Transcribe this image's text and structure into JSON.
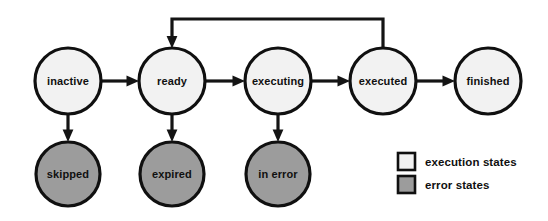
{
  "diagram": {
    "colors": {
      "background": "#ffffff",
      "stroke": "#101010",
      "execution_fill": "#f2f2f2",
      "error_fill": "#9c9c9c"
    },
    "nodes": [
      {
        "id": "inactive",
        "label": "inactive",
        "cx": 68,
        "cy": 81,
        "r": 33,
        "kind": "execution"
      },
      {
        "id": "ready",
        "label": "ready",
        "cx": 172,
        "cy": 81,
        "r": 33,
        "kind": "execution"
      },
      {
        "id": "executing",
        "label": "executing",
        "cx": 278,
        "cy": 81,
        "r": 33,
        "kind": "execution"
      },
      {
        "id": "executed",
        "label": "executed",
        "cx": 383,
        "cy": 81,
        "r": 33,
        "kind": "execution"
      },
      {
        "id": "finished",
        "label": "finished",
        "cx": 488,
        "cy": 81,
        "r": 33,
        "kind": "execution"
      },
      {
        "id": "skipped",
        "label": "skipped",
        "cx": 68,
        "cy": 174,
        "r": 32,
        "kind": "error"
      },
      {
        "id": "expired",
        "label": "expired",
        "cx": 172,
        "cy": 174,
        "r": 32,
        "kind": "error"
      },
      {
        "id": "in-error",
        "label": "in error",
        "cx": 278,
        "cy": 174,
        "r": 32,
        "kind": "error"
      }
    ],
    "edges": [
      {
        "id": "inactive-to-ready",
        "from": "inactive",
        "to": "ready",
        "kind": "horizontal"
      },
      {
        "id": "ready-to-executing",
        "from": "ready",
        "to": "executing",
        "kind": "horizontal"
      },
      {
        "id": "executing-to-executed",
        "from": "executing",
        "to": "executed",
        "kind": "horizontal"
      },
      {
        "id": "executed-to-finished",
        "from": "executed",
        "to": "finished",
        "kind": "horizontal"
      },
      {
        "id": "inactive-to-skipped",
        "from": "inactive",
        "to": "skipped",
        "kind": "vertical"
      },
      {
        "id": "ready-to-expired",
        "from": "ready",
        "to": "expired",
        "kind": "vertical"
      },
      {
        "id": "executing-to-in-error",
        "from": "executing",
        "to": "in-error",
        "kind": "vertical"
      },
      {
        "id": "executed-to-ready",
        "from": "executed",
        "to": "ready",
        "kind": "feedback-loop"
      }
    ],
    "legend": {
      "items": [
        {
          "id": "execution-states",
          "label": "execution states",
          "swatch": "#f2f2f2",
          "x": 398,
          "y": 153
        },
        {
          "id": "error-states",
          "label": "error states",
          "swatch": "#9c9c9c",
          "x": 398,
          "y": 176
        }
      ],
      "swatch_size": 17,
      "label_x": 425
    }
  }
}
